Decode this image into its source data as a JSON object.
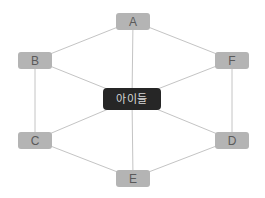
{
  "diagram": {
    "type": "hub-and-spoke hexagon",
    "colors": {
      "edge": "#c4c4c4",
      "outer_node_fill": "#b4b4b4",
      "outer_node_text": "#5a5a5a",
      "center_node_fill": "#262626",
      "center_node_text": "#d8d8d8"
    },
    "center": {
      "id": "center",
      "label": "아이들",
      "x": 132,
      "y": 99
    },
    "nodes": [
      {
        "id": "A",
        "label": "A",
        "x": 133,
        "y": 21
      },
      {
        "id": "B",
        "label": "B",
        "x": 35,
        "y": 60
      },
      {
        "id": "F",
        "label": "F",
        "x": 232,
        "y": 60
      },
      {
        "id": "C",
        "label": "C",
        "x": 35,
        "y": 140
      },
      {
        "id": "D",
        "label": "D",
        "x": 232,
        "y": 140
      },
      {
        "id": "E",
        "label": "E",
        "x": 133,
        "y": 178
      }
    ],
    "edges": [
      [
        "A",
        "B"
      ],
      [
        "A",
        "F"
      ],
      [
        "B",
        "C"
      ],
      [
        "F",
        "D"
      ],
      [
        "C",
        "E"
      ],
      [
        "D",
        "E"
      ],
      [
        "center",
        "A"
      ],
      [
        "center",
        "B"
      ],
      [
        "center",
        "C"
      ],
      [
        "center",
        "D"
      ],
      [
        "center",
        "E"
      ],
      [
        "center",
        "F"
      ]
    ]
  }
}
